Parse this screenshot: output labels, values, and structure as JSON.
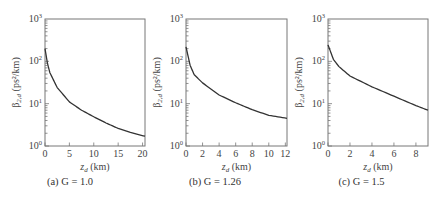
{
  "chart_data": [
    {
      "type": "line",
      "caption": "(a) G = 1.0",
      "xlabel": "z_d (km)",
      "ylabel": "β2,d (ps²/km)",
      "yscale": "log",
      "xlim": [
        0,
        20.5
      ],
      "ylim": [
        1,
        1000
      ],
      "xticks": [
        0,
        5,
        10,
        15,
        20
      ],
      "yticks": [
        "10^0",
        "10^1",
        "10^2",
        "10^3"
      ],
      "grid": false,
      "series": [
        {
          "name": "G = 1.0",
          "x": [
            0,
            0.5,
            1,
            2.5,
            5,
            7.5,
            10,
            12.5,
            15,
            17.5,
            20.5
          ],
          "y": [
            200,
            90,
            54,
            24,
            11,
            7.0,
            4.9,
            3.5,
            2.6,
            2.1,
            1.7
          ]
        }
      ]
    },
    {
      "type": "line",
      "caption": "(b) G = 1.26",
      "xlabel": "z_d (km)",
      "ylabel": "β2,d (ps²/km)",
      "yscale": "log",
      "xlim": [
        0,
        12.2
      ],
      "ylim": [
        1,
        1000
      ],
      "xticks": [
        0,
        2,
        4,
        6,
        8,
        10,
        12
      ],
      "yticks": [
        "10^0",
        "10^1",
        "10^2",
        "10^3"
      ],
      "grid": false,
      "series": [
        {
          "name": "G = 1.26",
          "x": [
            0,
            0.5,
            1,
            2,
            4,
            6,
            8,
            10,
            12.2
          ],
          "y": [
            220,
            80,
            48,
            31,
            16,
            10.5,
            7.2,
            5.3,
            4.5
          ]
        }
      ]
    },
    {
      "type": "line",
      "caption": "(c) G = 1.5",
      "xlabel": "z_d (km)",
      "ylabel": "β2,d (ps²/km)",
      "yscale": "log",
      "xlim": [
        0,
        9.1
      ],
      "ylim": [
        1,
        1000
      ],
      "xticks": [
        0,
        2,
        4,
        6,
        8
      ],
      "yticks": [
        "10^0",
        "10^1",
        "10^2",
        "10^3"
      ],
      "grid": false,
      "series": [
        {
          "name": "G = 1.5",
          "x": [
            0,
            0.5,
            1,
            2,
            4,
            6,
            8,
            9.1
          ],
          "y": [
            245,
            110,
            75,
            45,
            25,
            15,
            9,
            7
          ]
        }
      ]
    }
  ],
  "panels": [
    {
      "caption": "(a) G = 1.0",
      "xlabel_main": "z",
      "xlabel_sub": "d",
      "xlabel_unit": " (km)",
      "ylabel_main": "β",
      "ylabel_sub": "2,d",
      "ylabel_unit": " (ps²/km)"
    },
    {
      "caption": "(b) G = 1.26",
      "xlabel_main": "z",
      "xlabel_sub": "d",
      "xlabel_unit": " (km)",
      "ylabel_main": "β",
      "ylabel_sub": "2,d",
      "ylabel_unit": " (ps²/km)"
    },
    {
      "caption": "(c) G = 1.5",
      "xlabel_main": "z",
      "xlabel_sub": "d",
      "xlabel_unit": " (km)",
      "ylabel_main": "β",
      "ylabel_sub": "2,d",
      "ylabel_unit": " (ps²/km)"
    }
  ]
}
